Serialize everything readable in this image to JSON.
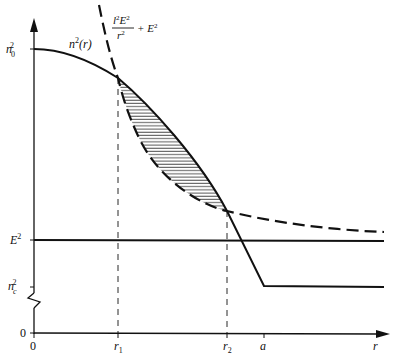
{
  "figure": {
    "type": "diagram",
    "y_axis": {
      "tick_labels": {
        "n0_sq": "n",
        "n0_sub": "0",
        "n0_sup": "2",
        "E_sq": "E",
        "E_sup": "2",
        "nc_sq": "n",
        "nc_sub": "c",
        "nc_sup": "2",
        "zero": "0"
      }
    },
    "x_axis": {
      "label": "r",
      "tick_labels": {
        "origin": "0",
        "r1": "r",
        "r1_sub": "1",
        "r2": "r",
        "r2_sub": "2",
        "a": "a"
      }
    },
    "curves": {
      "profile_label": "n",
      "profile_sup": "2",
      "profile_arg": "(r)",
      "potential_num": "l",
      "potential_num_sup": "2",
      "potential_num_E": "E",
      "potential_num_E_sup": "2",
      "potential_den": "r",
      "potential_den_sup": "2",
      "potential_plus": "+ E",
      "potential_plus_sup": "2"
    },
    "colors": {
      "ink": "#111111",
      "background": "#ffffff"
    }
  }
}
